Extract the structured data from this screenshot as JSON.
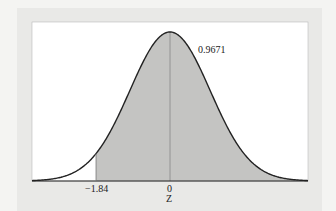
{
  "chart_data": {
    "type": "area",
    "title": "",
    "xlabel": "Z",
    "ylabel": "",
    "distribution": "standard normal",
    "shaded_region": {
      "from": -1.84,
      "to": "inf",
      "area": 0.9671
    },
    "tick_labels": [
      "-1.84",
      "0"
    ],
    "annotations": [
      {
        "text": "0.9671",
        "x": 0.8,
        "position": "right of peak"
      }
    ],
    "vertical_lines": [
      -1.84,
      0
    ],
    "xlim": [
      -3.4,
      3.4
    ],
    "grid": false,
    "colors": {
      "shade": "#c4c4c2",
      "curve": "#222222",
      "background": "#ffffff"
    }
  },
  "labels": {
    "area": "0.9671",
    "tick_left": "−1.84",
    "tick_zero": "0",
    "axis": "Z"
  }
}
